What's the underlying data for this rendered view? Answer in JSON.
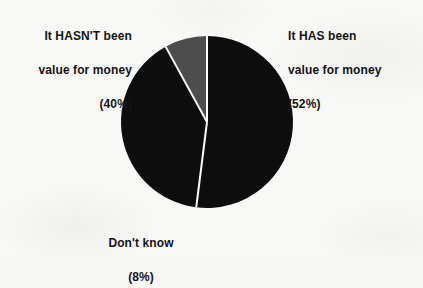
{
  "chart_data": {
    "type": "pie",
    "title": "",
    "subtitle": "",
    "xlabel": "",
    "ylabel": "",
    "legend_position": "none",
    "grid": false,
    "units": "percent",
    "categories": [
      "It HAS been value for money",
      "It HASN'T been value for money",
      "Don't know"
    ],
    "values": [
      52,
      40,
      8
    ],
    "slices": [
      {
        "name": "It HAS been value for money",
        "value": 52,
        "value_label": "(52%)",
        "color": "#0d0d0d",
        "label_lines": [
          "It HAS been",
          "value for money",
          "(52%)"
        ],
        "label_align": "left"
      },
      {
        "name": "It HASN'T been value for money",
        "value": 40,
        "value_label": "(40%)",
        "color": "#0d0d0d",
        "label_lines": [
          "It HASN'T been",
          "value for money",
          "(40%)"
        ],
        "label_align": "right"
      },
      {
        "name": "Don't know",
        "value": 8,
        "value_label": "(8%)",
        "color": "#4d4d4d",
        "label_lines": [
          "Don't know",
          "(8%)"
        ],
        "label_align": "center"
      }
    ]
  },
  "labels": {
    "hasnt": {
      "line1": "It HASN'T been",
      "line2": "value for money",
      "line3": "(40%)",
      "text": "It HASN'T been\nvalue for money\n(40%)"
    },
    "has": {
      "line1": "It HAS been",
      "line2": "value for money",
      "line3": "(52%)",
      "text": "It HAS been\nvalue for money\n(52%)"
    },
    "dont_know": {
      "line1": "Don't know",
      "line2": "(8%)",
      "text": "Don't know\n(8%)"
    }
  },
  "colors": {
    "background": "#f8f8f6",
    "slice_black": "#0d0d0d",
    "slice_gray": "#4d4d4d",
    "separator": "#fbfbfa",
    "text": "#141414"
  },
  "geometry": {
    "center_x": 207,
    "center_y": 122,
    "radius": 86,
    "start_angle_deg": -90,
    "direction": "clockwise"
  }
}
